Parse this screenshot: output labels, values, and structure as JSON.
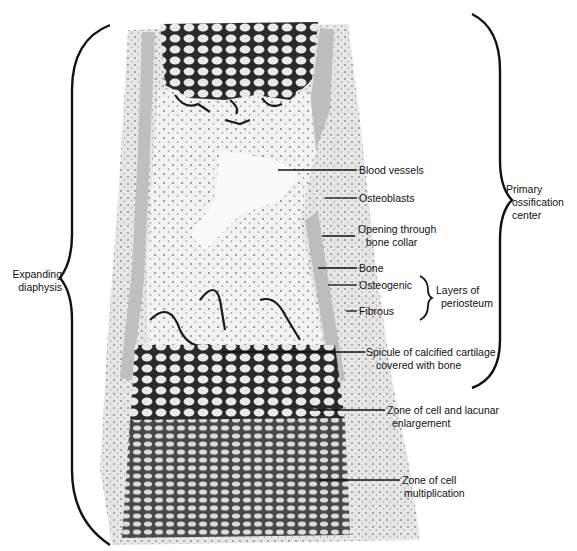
{
  "figure": {
    "colors": {
      "background": "#ffffff",
      "ink": "#111111",
      "periosteum_tissue": "#e2e2e2",
      "bone_collar": "#bdbdbd",
      "marrow": "#f4f4f4",
      "cartilage_matrix": "#5a5a5a",
      "calcified_cartilage": "#1e1e1e"
    },
    "brackets": {
      "left": {
        "line1": "Expanding",
        "line2": "diaphysis"
      },
      "right": {
        "line1": "Primary",
        "line2": "ossification",
        "line3": "center"
      },
      "periosteum": {
        "line1": "Layers of",
        "line2": "periosteum"
      }
    },
    "labels": [
      {
        "id": "blood-vessels",
        "line1": "Blood vessels",
        "line2": ""
      },
      {
        "id": "osteoblasts",
        "line1": "Osteoblasts",
        "line2": ""
      },
      {
        "id": "opening-through-bone-collar",
        "line1": "Opening through",
        "line2": "bone collar"
      },
      {
        "id": "bone",
        "line1": "Bone",
        "line2": ""
      },
      {
        "id": "osteogenic",
        "line1": "Osteogenic",
        "line2": ""
      },
      {
        "id": "fibrous",
        "line1": "Fibrous",
        "line2": ""
      },
      {
        "id": "spicule",
        "line1": "Spicule of calcified cartilage",
        "line2": "covered with bone"
      },
      {
        "id": "zone-enlargement",
        "line1": "Zone of cell and lacunar",
        "line2": "enlargement"
      },
      {
        "id": "zone-multiplication",
        "line1": "Zone of cell",
        "line2": "multiplication"
      }
    ]
  }
}
